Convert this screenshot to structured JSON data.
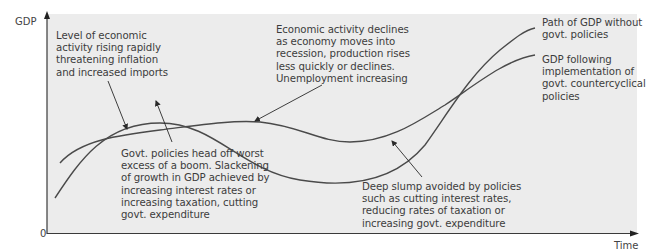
{
  "diagram": {
    "y_axis_label": "GDP",
    "x_axis_label": "Time",
    "origin_label": "0",
    "colors": {
      "plot_background": "#ececec",
      "curve": "#4a4a4a",
      "text": "#3c3c3c"
    },
    "series": [
      {
        "name": "Path of GDP without govt. policies"
      },
      {
        "name": "GDP following implementation of govt. countercyclical policies"
      }
    ],
    "annotations": {
      "boom": "Level of economic\nactivity rising rapidly\nthreatening inflation\nand increased imports",
      "recession": "Economic activity declines\nas economy moves into\nrecession, production rises\nless quickly or declines.\nUnemployment increasing",
      "without_policies": "Path of GDP without\ngovt. policies",
      "with_policies": "GDP following\nimplementation of\ngovt. countercyclical\npolicies",
      "head_off_boom": "Govt. policies head off worst\nexcess of a boom. Slackening\nof growth in GDP achieved by\nincreasing interest rates or\nincreasing taxation, cutting\ngovt. expenditure",
      "slump_avoided": "Deep slump avoided by policies\nsuch as cutting interest rates,\nreducing rates of taxation or\nincreasing govt. expenditure"
    }
  }
}
